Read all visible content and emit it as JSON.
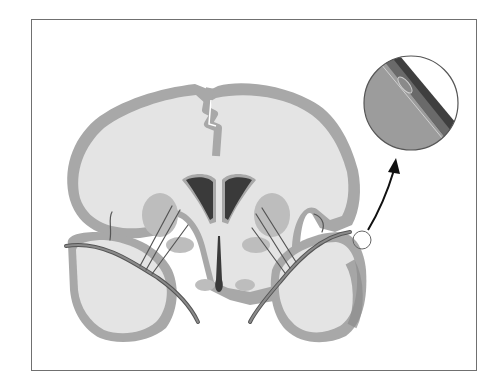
{
  "figure": {
    "type": "anatomical-illustration",
    "colors": {
      "frame": "#707070",
      "white_matter": "#e4e4e4",
      "gray_matter": "#a8a8a8",
      "ventricle": "#3a3a3a",
      "vessel": "#555555",
      "inset_fill": "#9c9c9c",
      "arrow": "#111111"
    },
    "elements": [
      "brain-section",
      "lateral-ventricles",
      "third-ventricle",
      "penetrating-arteries",
      "highlight-circle",
      "magnified-inset",
      "pointer-arrow"
    ]
  }
}
